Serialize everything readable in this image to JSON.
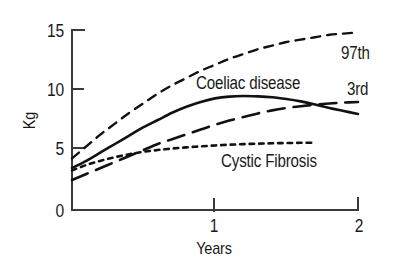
{
  "chart_data": {
    "type": "line",
    "title": "",
    "subtitle": "",
    "xlabel": "Years",
    "ylabel": "Kg",
    "xlim": [
      0,
      2
    ],
    "ylim": [
      0,
      15
    ],
    "x_ticks": [
      "1",
      "2"
    ],
    "x_tick_values": [
      1,
      2
    ],
    "y_ticks": [
      "0",
      "5",
      "10",
      "15"
    ],
    "y_tick_values": [
      0,
      5,
      10,
      15
    ],
    "grid": false,
    "legend_position": "inline-annotations",
    "series": [
      {
        "name": "97th",
        "label": "97th",
        "style": "short-dashed",
        "color": "#111111",
        "x": [
          0.0,
          0.1,
          0.2,
          0.3,
          0.4,
          0.5,
          0.6,
          0.7,
          0.8,
          0.9,
          1.0,
          1.1,
          1.2,
          1.3,
          1.4,
          1.5,
          1.6,
          1.7,
          1.8,
          1.9,
          2.0
        ],
        "y": [
          4.3,
          5.3,
          6.3,
          7.2,
          8.1,
          8.9,
          9.7,
          10.4,
          11.0,
          11.6,
          12.1,
          12.6,
          13.0,
          13.4,
          13.7,
          14.0,
          14.2,
          14.4,
          14.6,
          14.7,
          14.8
        ]
      },
      {
        "name": "Coeliac disease",
        "label": "Coeliac disease",
        "style": "solid",
        "color": "#111111",
        "x": [
          0.0,
          0.1,
          0.2,
          0.3,
          0.4,
          0.5,
          0.6,
          0.7,
          0.8,
          0.9,
          1.0,
          1.1,
          1.2,
          1.3,
          1.4,
          1.5,
          1.6,
          1.7,
          1.8,
          1.9,
          2.0
        ],
        "y": [
          3.5,
          4.1,
          4.8,
          5.5,
          6.2,
          6.9,
          7.5,
          8.1,
          8.6,
          9.0,
          9.3,
          9.45,
          9.5,
          9.47,
          9.4,
          9.25,
          9.05,
          8.8,
          8.5,
          8.25,
          8.0
        ]
      },
      {
        "name": "3rd",
        "label": "3rd",
        "style": "long-dashed",
        "color": "#111111",
        "x": [
          0.0,
          0.1,
          0.2,
          0.3,
          0.4,
          0.5,
          0.6,
          0.7,
          0.8,
          0.9,
          1.0,
          1.1,
          1.2,
          1.3,
          1.4,
          1.5,
          1.6,
          1.7,
          1.8,
          1.9,
          2.0
        ],
        "y": [
          2.5,
          3.0,
          3.5,
          4.0,
          4.5,
          5.0,
          5.5,
          5.9,
          6.3,
          6.7,
          7.1,
          7.45,
          7.75,
          8.05,
          8.3,
          8.5,
          8.65,
          8.78,
          8.88,
          8.95,
          9.0
        ]
      },
      {
        "name": "Cystic Fibrosis",
        "label": "Cystic Fibrosis",
        "style": "dotted",
        "color": "#111111",
        "x": [
          0.0,
          0.1,
          0.2,
          0.3,
          0.4,
          0.5,
          0.6,
          0.7,
          0.8,
          0.9,
          1.0,
          1.1,
          1.2,
          1.3,
          1.4,
          1.5,
          1.6,
          1.7
        ],
        "y": [
          3.3,
          3.75,
          4.1,
          4.4,
          4.65,
          4.85,
          5.0,
          5.12,
          5.22,
          5.3,
          5.38,
          5.44,
          5.49,
          5.53,
          5.56,
          5.58,
          5.6,
          5.6
        ]
      }
    ],
    "annotations": [
      {
        "text": "Coeliac disease",
        "x": 1.0,
        "y": 10.5
      },
      {
        "text": "Cystic Fibrosis",
        "x": 1.25,
        "y": 4.6
      },
      {
        "text": "97th",
        "x": 1.95,
        "y": 13.4
      },
      {
        "text": "3rd",
        "x": 2.0,
        "y": 10.5
      }
    ]
  },
  "axes": {
    "ylabel": "Kg",
    "xlabel": "Years",
    "y_ticks": [
      {
        "label": "15"
      },
      {
        "label": "10"
      },
      {
        "label": "5"
      },
      {
        "label": "0"
      }
    ],
    "x_ticks": [
      {
        "label": "1"
      },
      {
        "label": "2"
      }
    ]
  },
  "labels": {
    "coeliac": "Coeliac disease",
    "cystic": "Cystic Fibrosis",
    "p97": "97th",
    "p3": "3rd"
  },
  "colors": {
    "ink": "#111111",
    "axis": "#3a3a3a",
    "background": "#ffffff"
  }
}
